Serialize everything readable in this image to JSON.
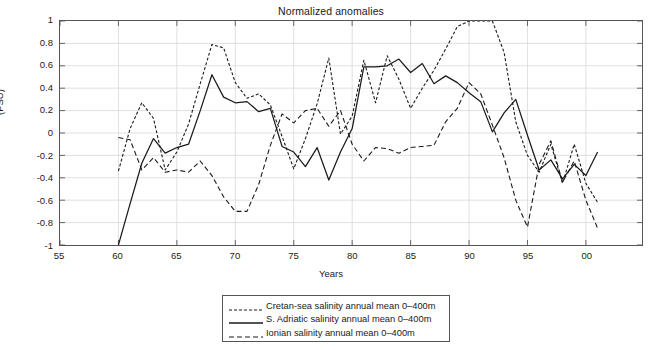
{
  "chart_data": {
    "type": "line",
    "title": "Normalized anomalies",
    "xlabel": "Years",
    "ylabel": "(PSU)",
    "xlim": [
      1955,
      2004.8
    ],
    "ylim": [
      -1,
      1
    ],
    "grid": true,
    "xticks": [
      1955,
      1960,
      1965,
      1970,
      1975,
      1980,
      1985,
      1990,
      1995,
      2000
    ],
    "xticklabels": [
      "55",
      "60",
      "65",
      "70",
      "75",
      "80",
      "85",
      "90",
      "95",
      "00"
    ],
    "yticks": [
      -1,
      -0.8,
      -0.6,
      -0.4,
      -0.2,
      0,
      0.2,
      0.4,
      0.6,
      0.8,
      1
    ],
    "yticklabels": [
      "-1",
      "-0.8",
      "-0.6",
      "-0.4",
      "-0.2",
      "0",
      "0.2",
      "0.4",
      "0.6",
      "0.8",
      "1"
    ],
    "legend_position": "below-center",
    "series": [
      {
        "name": "Cretan-sea salinity annual mean 0–400m",
        "style": "dashed-fine",
        "color": "#1a1a1a",
        "x": [
          1960,
          1961,
          1962,
          1963,
          1964,
          1965,
          1966,
          1967,
          1968,
          1969,
          1970,
          1971,
          1972,
          1973,
          1974,
          1975,
          1976,
          1977,
          1978,
          1979,
          1980,
          1981,
          1982,
          1983,
          1984,
          1985,
          1986,
          1987,
          1988,
          1989,
          1990,
          1991,
          1992,
          1993,
          1994,
          1995,
          1996,
          1997,
          1998,
          1999,
          2000,
          2001
        ],
        "y": [
          -0.34,
          0.04,
          0.27,
          0.13,
          -0.33,
          -0.17,
          0.08,
          0.44,
          0.79,
          0.76,
          0.45,
          0.31,
          0.35,
          0.25,
          -0.03,
          -0.32,
          -0.05,
          0.26,
          0.67,
          -0.01,
          0.15,
          0.65,
          0.27,
          0.69,
          0.48,
          0.22,
          0.4,
          0.56,
          0.75,
          0.95,
          1.0,
          1.0,
          1.0,
          0.72,
          0.1,
          -0.2,
          -0.35,
          -0.1,
          -0.45,
          -0.1,
          -0.45,
          -0.62
        ]
      },
      {
        "name": "S. Adriatic salinity annual mean 0–400m",
        "style": "solid",
        "color": "#1a1a1a",
        "x": [
          1960,
          1961,
          1962,
          1963,
          1964,
          1965,
          1966,
          1967,
          1968,
          1969,
          1970,
          1971,
          1972,
          1973,
          1974,
          1975,
          1976,
          1977,
          1978,
          1979,
          1980,
          1981,
          1982,
          1983,
          1984,
          1985,
          1986,
          1987,
          1988,
          1989,
          1990,
          1991,
          1992,
          1993,
          1994,
          1995,
          1996,
          1997,
          1998,
          1999,
          2000,
          2001
        ],
        "y": [
          -1.0,
          -0.63,
          -0.27,
          -0.05,
          -0.18,
          -0.13,
          -0.1,
          0.2,
          0.52,
          0.32,
          0.27,
          0.28,
          0.19,
          0.22,
          -0.12,
          -0.17,
          -0.3,
          -0.13,
          -0.42,
          -0.17,
          0.04,
          0.59,
          0.59,
          0.6,
          0.66,
          0.54,
          0.62,
          0.44,
          0.51,
          0.45,
          0.36,
          0.28,
          0.01,
          0.18,
          0.3,
          -0.02,
          -0.33,
          -0.24,
          -0.41,
          -0.28,
          -0.38,
          -0.17
        ]
      },
      {
        "name": "Ionian salinity annual mean 0–400m",
        "style": "dashed-coarse",
        "color": "#1a1a1a",
        "x": [
          1960,
          1961,
          1962,
          1963,
          1964,
          1965,
          1966,
          1967,
          1968,
          1969,
          1970,
          1971,
          1972,
          1973,
          1974,
          1975,
          1976,
          1977,
          1978,
          1979,
          1980,
          1981,
          1982,
          1983,
          1984,
          1985,
          1986,
          1987,
          1988,
          1989,
          1990,
          1991,
          1992,
          1993,
          1994,
          1995,
          1996,
          1997,
          1998,
          1999,
          2000,
          2001
        ],
        "y": [
          -0.04,
          -0.06,
          -0.33,
          -0.22,
          -0.35,
          -0.33,
          -0.35,
          -0.25,
          -0.38,
          -0.57,
          -0.7,
          -0.7,
          -0.46,
          -0.11,
          0.17,
          0.09,
          0.2,
          0.22,
          0.06,
          0.2,
          -0.1,
          -0.25,
          -0.13,
          -0.14,
          -0.18,
          -0.13,
          -0.12,
          -0.11,
          0.1,
          0.22,
          0.45,
          0.35,
          0.07,
          -0.22,
          -0.6,
          -0.84,
          -0.28,
          -0.07,
          -0.44,
          -0.25,
          -0.6,
          -0.85
        ]
      }
    ]
  },
  "legend": {
    "items": [
      {
        "label": "Cretan-sea salinity annual mean 0–400m",
        "style": "dashed-fine"
      },
      {
        "label": "S. Adriatic salinity annual mean 0–400m",
        "style": "solid"
      },
      {
        "label": "Ionian salinity annual mean 0–400m",
        "style": "dashed-coarse"
      }
    ]
  }
}
